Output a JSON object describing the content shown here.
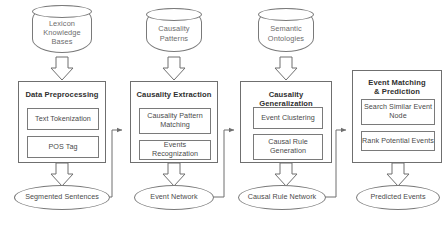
{
  "diagram": {
    "stroke_color": "#7a7a7a",
    "text_color": "#4a4a4a",
    "background": "#ffffff",
    "sources": [
      {
        "label": "Lexicon\nKnowledge\nBases",
        "line1": "Lexicon",
        "line2": "Knowledge",
        "line3": "Bases"
      },
      {
        "label": "Causality\nPatterns",
        "line1": "Causality",
        "line2": "Patterns",
        "line3": ""
      },
      {
        "label": "Semantic\nOntologies",
        "line1": "Semantic",
        "line2": "Ontologies",
        "line3": ""
      }
    ],
    "stages": [
      {
        "title": "Data Preprocessing",
        "title_line1": "Data Preprocessing",
        "title_line2": "",
        "steps": [
          {
            "line1": "Text Tokenization",
            "line2": ""
          },
          {
            "line1": "POS Tag",
            "line2": ""
          }
        ]
      },
      {
        "title": "Causality Extraction",
        "title_line1": "Causality Extraction",
        "title_line2": "",
        "steps": [
          {
            "line1": "Causality Pattern",
            "line2": "Matching"
          },
          {
            "line1": "Events Recognization",
            "line2": ""
          }
        ]
      },
      {
        "title": "Causality Generalization",
        "title_line1": "Causality Generalization",
        "title_line2": "",
        "steps": [
          {
            "line1": "Event Clustering",
            "line2": ""
          },
          {
            "line1": "Causal Rule",
            "line2": "Generation"
          }
        ]
      },
      {
        "title": "Event Matching & Prediction",
        "title_line1": "Event Matching",
        "title_line2": "& Prediction",
        "steps": [
          {
            "line1": "Search Similar Event",
            "line2": "Node"
          },
          {
            "line1": "Rank Potential Events",
            "line2": ""
          }
        ]
      }
    ],
    "outputs": [
      {
        "label": "Segmented Sentences"
      },
      {
        "label": "Event Network"
      },
      {
        "label": "Causal Rule Network"
      },
      {
        "label": "Predicted Events"
      }
    ]
  }
}
